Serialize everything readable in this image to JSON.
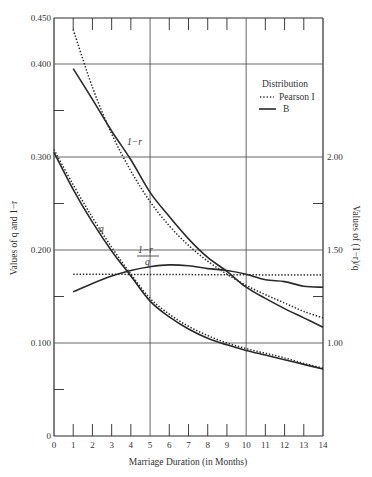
{
  "chart_data": {
    "type": "line",
    "title": "",
    "xlabel": "Marriage Duration (in Months)",
    "ylabel": "Values of q and 1−r",
    "ylabel_right": "Values of (1−r)/q",
    "xlim": [
      0,
      14
    ],
    "ylim": [
      0,
      0.45
    ],
    "ylim_right_mapping": "right = 5 × left + 0.5 (0.100→1.00, 0.200→1.50, 0.300→2.00)",
    "x_ticks": [
      "0",
      "1",
      "2",
      "3",
      "4",
      "5",
      "6",
      "7",
      "8",
      "9",
      "10",
      "11",
      "12",
      "13",
      "14"
    ],
    "y_ticks": [
      "0",
      "0.100",
      "0.200",
      "0.300",
      "0.400",
      "0.450"
    ],
    "y_ticks_right": [
      "1.00",
      "1.50",
      "2.00"
    ],
    "grid": "major gridlines at x=5,10 and y=0.100,0.200,0.300,0.400",
    "legend": {
      "title": "Distribution",
      "position": "upper right",
      "entries": [
        {
          "label": "Pearson I",
          "style": "dotted"
        },
        {
          "label": "B",
          "style": "solid"
        }
      ]
    },
    "annotations": [
      "1−r",
      "q",
      "(1−r)/q"
    ],
    "series": [
      {
        "name": "1−r (B)",
        "style": "solid",
        "axis": "left",
        "x": [
          1,
          2,
          3,
          4,
          5,
          6,
          7,
          8,
          9,
          10,
          11,
          12,
          13,
          14
        ],
        "values": [
          0.395,
          0.362,
          0.328,
          0.297,
          0.262,
          0.236,
          0.212,
          0.192,
          0.177,
          0.16,
          0.148,
          0.137,
          0.127,
          0.117
        ]
      },
      {
        "name": "1−r (Pearson I)",
        "style": "dotted",
        "axis": "left",
        "x": [
          1,
          2,
          3,
          4,
          5,
          6,
          7,
          8,
          9,
          10,
          11,
          12,
          13,
          14
        ],
        "values": [
          0.437,
          0.375,
          0.325,
          0.285,
          0.252,
          0.226,
          0.205,
          0.188,
          0.174,
          0.162,
          0.152,
          0.143,
          0.134,
          0.127
        ]
      },
      {
        "name": "q (B)",
        "style": "solid",
        "axis": "left",
        "x": [
          0,
          1,
          2,
          3,
          4,
          5,
          6,
          7,
          8,
          9,
          10,
          11,
          12,
          13,
          14
        ],
        "values": [
          0.305,
          0.265,
          0.23,
          0.199,
          0.172,
          0.145,
          0.128,
          0.115,
          0.105,
          0.098,
          0.092,
          0.087,
          0.082,
          0.077,
          0.072
        ]
      },
      {
        "name": "q (Pearson I)",
        "style": "dotted",
        "axis": "left",
        "x": [
          0,
          1,
          2,
          3,
          4,
          5,
          6,
          7,
          8,
          9,
          10,
          11,
          12,
          13,
          14
        ],
        "values": [
          0.308,
          0.27,
          0.235,
          0.203,
          0.174,
          0.148,
          0.131,
          0.118,
          0.108,
          0.1,
          0.094,
          0.089,
          0.084,
          0.078,
          0.073
        ]
      },
      {
        "name": "(1−r)/q (B)",
        "style": "solid",
        "axis": "right",
        "x": [
          1,
          2,
          3,
          4,
          5,
          6,
          7,
          8,
          9,
          10,
          11,
          12,
          13,
          14
        ],
        "values": [
          1.275,
          1.32,
          1.36,
          1.39,
          1.41,
          1.42,
          1.415,
          1.4,
          1.39,
          1.37,
          1.34,
          1.33,
          1.305,
          1.3
        ]
      },
      {
        "name": "(1−r)/q (Pearson I)",
        "style": "dotted",
        "axis": "right",
        "x": [
          1,
          14
        ],
        "values": [
          1.37,
          1.365
        ]
      }
    ]
  },
  "labels": {
    "legend_title": "Distribution",
    "legend_pearson": "Pearson I",
    "legend_b": "B",
    "ann_1mr": "1−r",
    "ann_q": "q",
    "ann_ratio_num": "1−r",
    "ann_ratio_den": "q",
    "xlabel": "Marriage Duration (in Months)",
    "ylabel": "Values of q and 1−r",
    "ylabel_right": "Values of (1−r)/q"
  },
  "style": {
    "ink": "#2a2a2a",
    "grid": "#555555",
    "background": "#ffffff"
  }
}
